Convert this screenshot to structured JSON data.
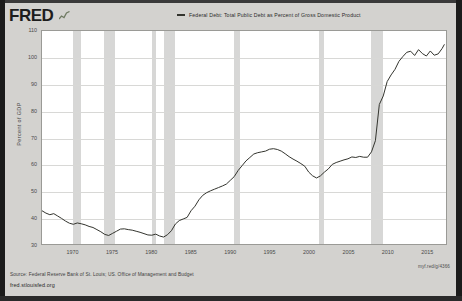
{
  "header": {
    "logo_text": "FRED",
    "logo_mark_icon": "mini-line-chart-icon"
  },
  "legend": {
    "swatch_icon": "legend-line-swatch",
    "label": "Federal Debt: Total Public Debt as Percent of Gross Domestic Product"
  },
  "footer": {
    "source": "Source: Federal Reserve Bank of St. Louis; US. Office of Management and Budget",
    "url": "fred.stlouisfed.org",
    "shortlink": "myf.red/g/4366"
  },
  "chart_data": {
    "type": "line",
    "title": "Federal Debt: Total Public Debt as Percent of Gross Domestic Product",
    "xlabel": "",
    "ylabel": "Percent of GDP",
    "ylim": [
      30,
      110
    ],
    "xlim": [
      1966,
      2017.5
    ],
    "yticks": [
      110,
      100,
      90,
      80,
      70,
      60,
      50,
      40,
      30
    ],
    "xticks": [
      1970,
      1975,
      1980,
      1985,
      1990,
      1995,
      2000,
      2005,
      2010,
      2015
    ],
    "grid": true,
    "legend_position": "top-center",
    "line_color": "#33342e",
    "recession_band_color": "#d4d4d2",
    "recession_bands": [
      [
        1969.92,
        1970.92
      ],
      [
        1973.92,
        1975.25
      ],
      [
        1980.0,
        1980.58
      ],
      [
        1981.5,
        1982.92
      ],
      [
        1990.5,
        1991.25
      ],
      [
        2001.25,
        2001.92
      ],
      [
        2007.92,
        2009.5
      ]
    ],
    "series": [
      {
        "name": "Federal Debt: Total Public Debt as Percent of Gross Domestic Product",
        "x": [
          1966.0,
          1966.5,
          1967.0,
          1967.5,
          1968.0,
          1968.5,
          1969.0,
          1969.5,
          1970.0,
          1970.5,
          1971.0,
          1971.5,
          1972.0,
          1972.5,
          1973.0,
          1973.5,
          1974.0,
          1974.5,
          1975.0,
          1975.5,
          1976.0,
          1976.5,
          1977.0,
          1977.5,
          1978.0,
          1978.5,
          1979.0,
          1979.5,
          1980.0,
          1980.5,
          1981.0,
          1981.5,
          1982.0,
          1982.5,
          1983.0,
          1983.5,
          1984.0,
          1984.5,
          1985.0,
          1985.5,
          1986.0,
          1986.5,
          1987.0,
          1987.5,
          1988.0,
          1988.5,
          1989.0,
          1989.5,
          1990.0,
          1990.5,
          1991.0,
          1991.5,
          1992.0,
          1992.5,
          1993.0,
          1993.5,
          1994.0,
          1994.5,
          1995.0,
          1995.5,
          1996.0,
          1996.5,
          1997.0,
          1997.5,
          1998.0,
          1998.5,
          1999.0,
          1999.5,
          2000.0,
          2000.5,
          2001.0,
          2001.5,
          2002.0,
          2002.5,
          2003.0,
          2003.5,
          2004.0,
          2004.5,
          2005.0,
          2005.5,
          2006.0,
          2006.5,
          2007.0,
          2007.5,
          2008.0,
          2008.5,
          2009.0,
          2009.5,
          2010.0,
          2010.5,
          2011.0,
          2011.5,
          2012.0,
          2012.5,
          2013.0,
          2013.5,
          2014.0,
          2014.5,
          2015.0,
          2015.5,
          2016.0,
          2016.5,
          2017.0,
          2017.3
        ],
        "values": [
          42.5,
          41.6,
          41.0,
          41.4,
          40.5,
          39.6,
          38.6,
          37.8,
          37.4,
          37.9,
          37.6,
          37.2,
          36.6,
          36.2,
          35.4,
          34.6,
          33.6,
          33.2,
          34.0,
          34.8,
          35.6,
          35.7,
          35.4,
          35.2,
          34.8,
          34.4,
          33.9,
          33.4,
          33.3,
          33.7,
          33.0,
          32.6,
          33.5,
          35.0,
          37.5,
          38.8,
          39.4,
          40.0,
          42.5,
          44.2,
          46.6,
          48.3,
          49.3,
          50.0,
          50.6,
          51.2,
          51.8,
          52.5,
          53.9,
          55.3,
          57.6,
          59.4,
          61.2,
          62.5,
          63.8,
          64.3,
          64.6,
          64.9,
          65.6,
          65.8,
          65.5,
          64.9,
          63.9,
          62.8,
          61.9,
          61.1,
          60.2,
          59.2,
          57.0,
          55.6,
          54.8,
          55.6,
          57.0,
          58.2,
          59.9,
          60.6,
          61.1,
          61.6,
          62.0,
          62.7,
          62.5,
          62.9,
          62.6,
          62.6,
          64.6,
          68.8,
          82.4,
          85.6,
          91.0,
          93.5,
          95.6,
          98.6,
          100.4,
          102.0,
          102.4,
          100.8,
          103.0,
          101.5,
          100.6,
          102.5,
          100.9,
          101.4,
          103.4,
          105.0
        ]
      }
    ]
  }
}
